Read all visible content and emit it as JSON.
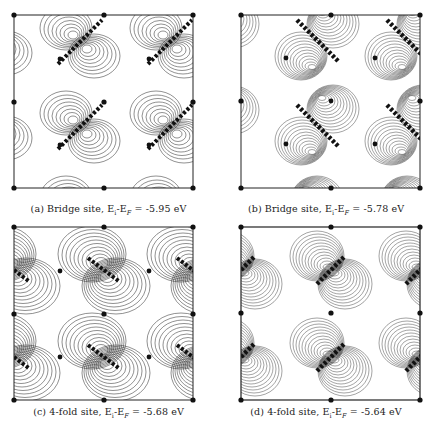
{
  "figure": {
    "panels": [
      {
        "id": "a",
        "label": "(a)",
        "site": "Bridge site,",
        "energy_label": "E",
        "energy_sub": "i",
        "fermi_label": "-E",
        "fermi_sub": "F",
        "eq": " = ",
        "value": "-5.95 eV",
        "caption": "(a) Bridge site, Ei-EF = -5.95 eV"
      },
      {
        "id": "b",
        "label": "(b)",
        "site": "Bridge site,",
        "energy_label": "E",
        "energy_sub": "i",
        "fermi_label": "-E",
        "fermi_sub": "F",
        "eq": " = ",
        "value": "-5.78 eV",
        "caption": "(b) Bridge site, Ei-EF = -5.78 eV"
      },
      {
        "id": "c",
        "label": "(c)",
        "site": "4-fold site,",
        "energy_label": "E",
        "energy_sub": "i",
        "fermi_label": "-E",
        "fermi_sub": "F",
        "eq": " = ",
        "value": "-5.68 eV",
        "caption": "(c) 4-fold site, Ei-EF = -5.68 eV"
      },
      {
        "id": "d",
        "label": "(d)",
        "site": "4-fold site,",
        "energy_label": "E",
        "energy_sub": "i",
        "fermi_label": "-E",
        "fermi_sub": "F",
        "eq": " = ",
        "value": "-5.64 eV",
        "caption": "(d) 4-fold site, Ei-EF = -5.64 eV"
      }
    ]
  },
  "colors": {
    "ink": "#1a1a1a",
    "background": "#ffffff"
  }
}
